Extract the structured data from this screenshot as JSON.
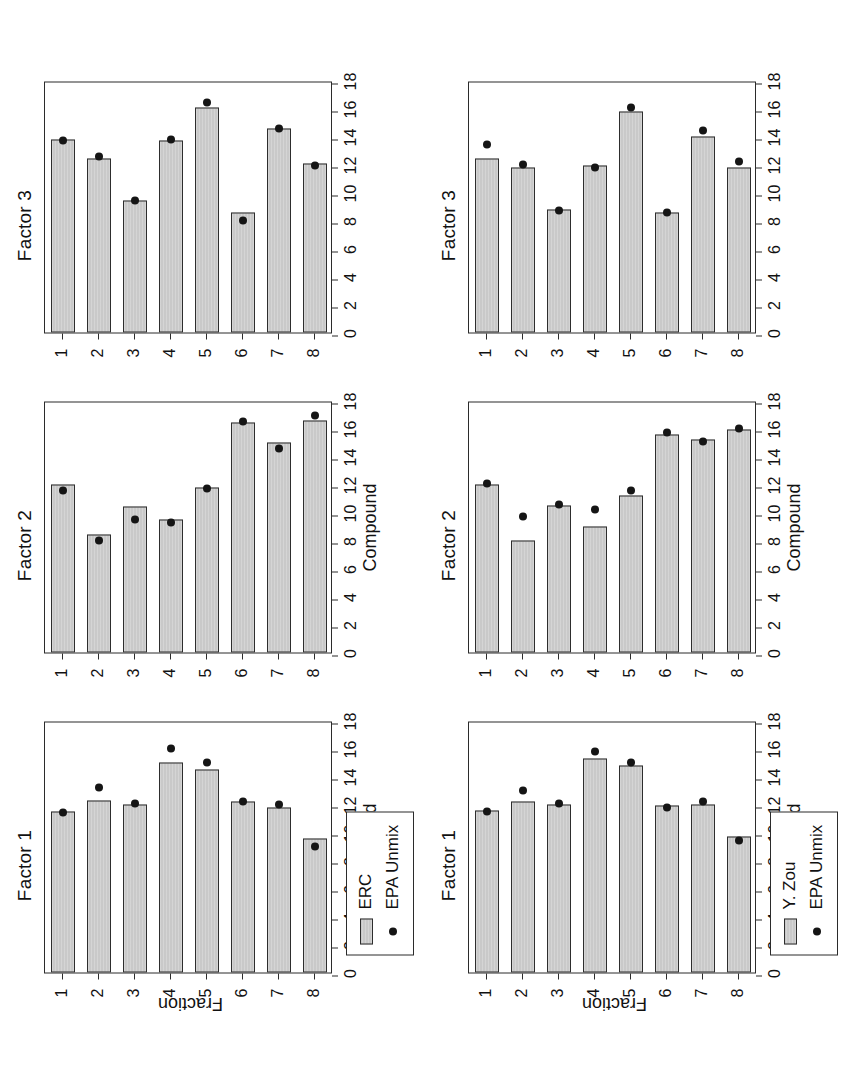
{
  "figure": {
    "rotation_note": "rotated",
    "axis_titles": {
      "x": "Compound",
      "y": "Fraction"
    }
  },
  "chart_data": [
    {
      "id": "row1-factor1",
      "type": "bar",
      "title": "Factor 1",
      "xlabel": "Compound",
      "ylabel": "Fraction",
      "ylim": [
        0,
        18
      ],
      "yticks": [
        0,
        2,
        4,
        6,
        8,
        10,
        12,
        14,
        16,
        18
      ],
      "categories": [
        "1",
        "2",
        "3",
        "4",
        "5",
        "6",
        "7",
        "8"
      ],
      "grid": false,
      "legend_position": "bottom-left",
      "series": [
        {
          "name": "ERC",
          "kind": "bar",
          "values": [
            11.5,
            12.3,
            12.0,
            15.0,
            14.5,
            12.2,
            11.8,
            9.6
          ]
        },
        {
          "name": "EPA Unmix",
          "kind": "point",
          "values": [
            11.4,
            13.2,
            12.1,
            16.0,
            15.0,
            12.2,
            12.0,
            9.0
          ]
        }
      ]
    },
    {
      "id": "row1-factor2",
      "type": "bar",
      "title": "Factor 2",
      "xlabel": "Compound",
      "ylabel": "Fraction",
      "ylim": [
        0,
        18
      ],
      "yticks": [
        0,
        2,
        4,
        6,
        8,
        10,
        12,
        14,
        16,
        18
      ],
      "categories": [
        "1",
        "2",
        "3",
        "4",
        "5",
        "6",
        "7",
        "8"
      ],
      "grid": false,
      "legend_position": "none",
      "series": [
        {
          "name": "ERC",
          "kind": "bar",
          "values": [
            12.0,
            8.4,
            10.4,
            9.5,
            11.8,
            16.4,
            15.0,
            16.6
          ]
        },
        {
          "name": "EPA Unmix",
          "kind": "point",
          "values": [
            11.6,
            8.0,
            9.5,
            9.3,
            11.7,
            16.5,
            14.6,
            16.9
          ]
        }
      ]
    },
    {
      "id": "row1-factor3",
      "type": "bar",
      "title": "Factor 3",
      "xlabel": "Compound",
      "ylabel": "Fraction",
      "ylim": [
        0,
        18
      ],
      "yticks": [
        0,
        2,
        4,
        6,
        8,
        10,
        12,
        14,
        16,
        18
      ],
      "categories": [
        "1",
        "2",
        "3",
        "4",
        "5",
        "6",
        "7",
        "8"
      ],
      "grid": false,
      "legend_position": "none",
      "series": [
        {
          "name": "ERC",
          "kind": "bar",
          "values": [
            13.8,
            12.4,
            9.4,
            13.7,
            16.1,
            8.6,
            14.6,
            12.1
          ]
        },
        {
          "name": "EPA Unmix",
          "kind": "point",
          "values": [
            13.7,
            12.6,
            9.4,
            13.8,
            16.4,
            8.0,
            14.6,
            11.9
          ]
        }
      ]
    },
    {
      "id": "row2-factor1",
      "type": "bar",
      "title": "Factor 1",
      "xlabel": "Compound",
      "ylabel": "Fraction",
      "ylim": [
        0,
        18
      ],
      "yticks": [
        0,
        2,
        4,
        6,
        8,
        10,
        12,
        14,
        16,
        18
      ],
      "categories": [
        "1",
        "2",
        "3",
        "4",
        "5",
        "6",
        "7",
        "8"
      ],
      "grid": false,
      "legend_position": "bottom-left",
      "series": [
        {
          "name": "Y. Zou",
          "kind": "bar",
          "values": [
            11.6,
            12.2,
            12.0,
            15.3,
            14.8,
            11.9,
            12.0,
            9.7
          ]
        },
        {
          "name": "EPA Unmix",
          "kind": "point",
          "values": [
            11.5,
            13.0,
            12.1,
            15.8,
            15.0,
            11.8,
            12.2,
            9.4
          ]
        }
      ]
    },
    {
      "id": "row2-factor2",
      "type": "bar",
      "title": "Factor 2",
      "xlabel": "Compound",
      "ylabel": "Fraction",
      "ylim": [
        0,
        18
      ],
      "yticks": [
        0,
        2,
        4,
        6,
        8,
        10,
        12,
        14,
        16,
        18
      ],
      "categories": [
        "1",
        "2",
        "3",
        "4",
        "5",
        "6",
        "7",
        "8"
      ],
      "grid": false,
      "legend_position": "none",
      "series": [
        {
          "name": "Y. Zou",
          "kind": "bar",
          "values": [
            12.0,
            8.0,
            10.5,
            9.0,
            11.2,
            15.6,
            15.2,
            15.9
          ]
        },
        {
          "name": "EPA Unmix",
          "kind": "point",
          "values": [
            12.1,
            9.7,
            10.6,
            10.2,
            11.6,
            15.7,
            15.1,
            16.0
          ]
        }
      ]
    },
    {
      "id": "row2-factor3",
      "type": "bar",
      "title": "Factor 3",
      "xlabel": "Compound",
      "ylabel": "Fraction",
      "ylim": [
        0,
        18
      ],
      "yticks": [
        0,
        2,
        4,
        6,
        8,
        10,
        12,
        14,
        16,
        18
      ],
      "categories": [
        "1",
        "2",
        "3",
        "4",
        "5",
        "6",
        "7",
        "8"
      ],
      "grid": false,
      "legend_position": "none",
      "series": [
        {
          "name": "Y. Zou",
          "kind": "bar",
          "values": [
            12.4,
            11.8,
            8.8,
            11.9,
            15.8,
            8.6,
            14.0,
            11.8
          ]
        },
        {
          "name": "EPA Unmix",
          "kind": "point",
          "values": [
            13.4,
            12.0,
            8.7,
            11.8,
            16.1,
            8.6,
            14.4,
            12.2
          ]
        }
      ]
    }
  ],
  "legends": {
    "row1": {
      "bar_label": "ERC",
      "point_label": "EPA Unmix"
    },
    "row2": {
      "bar_label": "Y. Zou",
      "point_label": "EPA Unmix"
    }
  }
}
